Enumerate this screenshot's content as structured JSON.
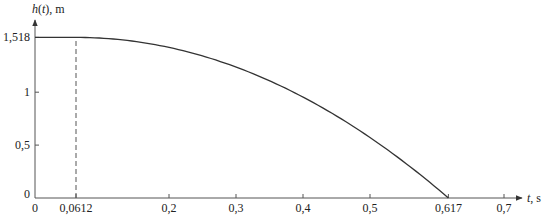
{
  "chart_data": {
    "type": "line",
    "title": "",
    "xlabel": "t, s",
    "ylabel": "h(t), m",
    "xlim": [
      0,
      0.72
    ],
    "ylim": [
      0,
      1.6
    ],
    "x_ticks": [
      {
        "value": 0,
        "label": "0"
      },
      {
        "value": 0.0612,
        "label": "0,0612"
      },
      {
        "value": 0.2,
        "label": "0,2"
      },
      {
        "value": 0.3,
        "label": "0,3"
      },
      {
        "value": 0.4,
        "label": "0,4"
      },
      {
        "value": 0.5,
        "label": "0,5"
      },
      {
        "value": 0.617,
        "label": "0,617"
      },
      {
        "value": 0.7,
        "label": "0,7"
      }
    ],
    "y_ticks": [
      {
        "value": 0,
        "label": "0"
      },
      {
        "value": 0.5,
        "label": "0,5"
      },
      {
        "value": 1,
        "label": "1"
      },
      {
        "value": 1.518,
        "label": "1,518"
      }
    ],
    "grid": false,
    "legend": null,
    "annotations": [
      {
        "type": "dashed-vertical",
        "x": 0.0612,
        "from_y": 0,
        "to_y": 1.518
      }
    ],
    "series": [
      {
        "name": "h(t)",
        "x": [
          0,
          0.0612,
          0.1,
          0.15,
          0.2,
          0.25,
          0.3,
          0.35,
          0.4,
          0.45,
          0.5,
          0.55,
          0.6,
          0.617
        ],
        "y": [
          1.518,
          1.518,
          1.511,
          1.479,
          1.423,
          1.343,
          1.238,
          1.109,
          0.955,
          0.777,
          0.575,
          0.348,
          0.097,
          0.0
        ]
      }
    ]
  },
  "axes": {
    "y_label_main": "h",
    "y_label_paren_open": "(",
    "y_label_var": "t",
    "y_label_rest": "), m",
    "x_label_var": "t",
    "x_label_rest": ", s",
    "origin_y_label": "0"
  }
}
